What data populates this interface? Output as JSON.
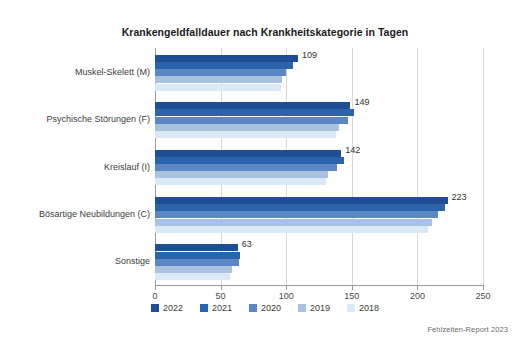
{
  "chart_data": {
    "type": "bar",
    "orientation": "horizontal",
    "title": "Krankengeldfalldauer nach Krankheitskategorie in Tagen",
    "xlabel": "",
    "ylabel": "",
    "xlim": [
      0,
      250
    ],
    "xticks": [
      0,
      50,
      100,
      150,
      200,
      250
    ],
    "grid": true,
    "legend_position": "bottom",
    "categories": [
      "Muskel-Skelett (M)",
      "Psychische Störungen (F)",
      "Kreislauf (I)",
      "Bösartige Neubildungen (C)",
      "Sonstige"
    ],
    "series": [
      {
        "name": "2022",
        "color": "#1f4e96",
        "values": [
          109,
          149,
          142,
          223,
          63
        ]
      },
      {
        "name": "2021",
        "color": "#2c64ac",
        "values": [
          105,
          152,
          144,
          221,
          65
        ]
      },
      {
        "name": "2020",
        "color": "#5b87c4",
        "values": [
          100,
          147,
          139,
          216,
          64
        ]
      },
      {
        "name": "2019",
        "color": "#a8c2e0",
        "values": [
          97,
          140,
          132,
          211,
          59
        ]
      },
      {
        "name": "2018",
        "color": "#dbe8f5",
        "values": [
          96,
          138,
          130,
          208,
          57
        ]
      }
    ],
    "value_labels": {
      "series": "2022",
      "values": [
        "109",
        "149",
        "142",
        "223",
        "63"
      ]
    }
  },
  "footer": {
    "source": "Fehlzeiten-Report 2023"
  },
  "axis": {
    "tick_labels": [
      "0",
      "50",
      "100",
      "150",
      "200",
      "250"
    ]
  }
}
